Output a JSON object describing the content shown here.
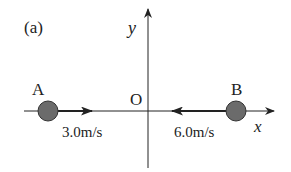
{
  "figure": {
    "panel_label": "(a)",
    "axes": {
      "x_label": "x",
      "y_label": "y",
      "origin_label": "O"
    },
    "objects": [
      {
        "name": "A",
        "velocity_label": "3.0m/s",
        "direction": "+x"
      },
      {
        "name": "B",
        "velocity_label": "6.0m/s",
        "direction": "-x"
      }
    ],
    "colors": {
      "ball_fill": "#6b6b6b",
      "line": "#222222"
    }
  }
}
